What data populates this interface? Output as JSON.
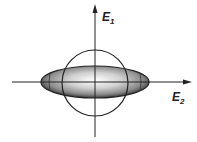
{
  "diagram": {
    "axes": {
      "vertical": {
        "label_main": "E",
        "label_sub": "1"
      },
      "horizontal": {
        "label_main": "E",
        "label_sub": "2"
      }
    },
    "shapes": [
      {
        "type": "circle",
        "name": "unit-circle"
      },
      {
        "type": "ellipse",
        "name": "shaded-ellipse"
      }
    ]
  }
}
